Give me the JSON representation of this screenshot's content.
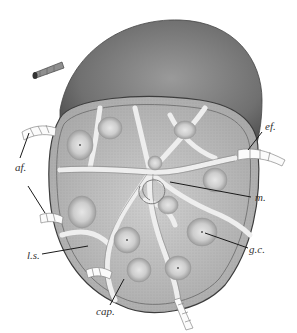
{
  "figure": {
    "colors": {
      "background": "#ffffff",
      "capsule_dark": "#6d6d6d",
      "capsule_mid": "#8a8a8a",
      "cortex": "#b5b5b5",
      "follicle": "#d6d6d6",
      "sinus": "#ececec",
      "leader_line": "#1a1a1a"
    },
    "labels": [
      {
        "id": "af",
        "text": "af.",
        "meaning": "afferent lymphatics"
      },
      {
        "id": "ef",
        "text": "ef.",
        "meaning": "efferent lymphatic"
      },
      {
        "id": "m",
        "text": "m.",
        "meaning": "medulla"
      },
      {
        "id": "ls",
        "text": "l.s.",
        "meaning": "lymph sinus"
      },
      {
        "id": "gc",
        "text": "g.c.",
        "meaning": "germinal centre"
      },
      {
        "id": "cap",
        "text": "cap.",
        "meaning": "capsule"
      }
    ]
  }
}
